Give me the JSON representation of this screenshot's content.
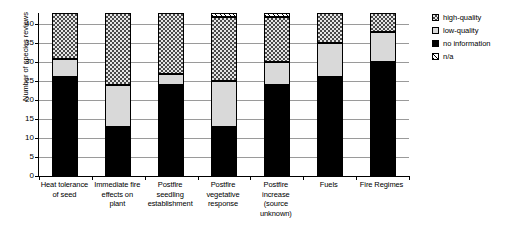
{
  "chart_data": {
    "type": "bar",
    "subtype": "stacked-vertical",
    "title": "",
    "xlabel": "",
    "ylabel": "Number of species reviews",
    "ylim": [
      0,
      43
    ],
    "yticks": [
      0,
      5,
      10,
      15,
      20,
      25,
      30,
      35,
      40
    ],
    "ytick_labels": [
      "0",
      "5",
      "10",
      "15",
      "20",
      "25",
      "30",
      "35",
      "40"
    ],
    "grid": true,
    "legend_position": "right",
    "categories": [
      "Heat tolerance of seed",
      "Immediate fire effects on plant",
      "Postfire seedling establishment",
      "Postfire vegetative response",
      "Postfire increase (source unknown)",
      "Fuels",
      "Fire Regimes"
    ],
    "category_lines": [
      [
        "Heat tolerance",
        "of seed"
      ],
      [
        "Immediate fire",
        "effects on",
        "plant"
      ],
      [
        "Postfire",
        "seedling",
        "establishment"
      ],
      [
        "Postfire",
        "vegetative",
        "response"
      ],
      [
        "Postfire",
        "increase",
        "(source",
        "unknown)"
      ],
      [
        "Fuels"
      ],
      [
        "Fire Regimes"
      ]
    ],
    "series": [
      {
        "name": "no information",
        "key": "noinfo",
        "pattern": "solid-black",
        "color": "#000000",
        "values": [
          26,
          13,
          24,
          13,
          24,
          26,
          30
        ]
      },
      {
        "name": "low-quality",
        "key": "low",
        "pattern": "light-gray",
        "color": "#d9d9d9",
        "values": [
          5,
          11,
          3,
          12,
          6,
          9,
          8
        ]
      },
      {
        "name": "high-quality",
        "key": "high",
        "pattern": "checkerboard",
        "color": "#8c8c8c",
        "values": [
          12,
          19,
          16,
          17,
          12,
          8,
          5
        ]
      },
      {
        "name": "n/a",
        "key": "na",
        "pattern": "diagonal-hatch",
        "color": "#ffffff",
        "values": [
          0,
          0,
          0,
          1,
          1,
          0,
          0
        ]
      }
    ],
    "totals": [
      43,
      43,
      43,
      43,
      43,
      43,
      43
    ]
  },
  "legend": {
    "items": [
      {
        "label": "high-quality"
      },
      {
        "label": "low-quality"
      },
      {
        "label": "no information"
      },
      {
        "label": "n/a"
      }
    ]
  }
}
